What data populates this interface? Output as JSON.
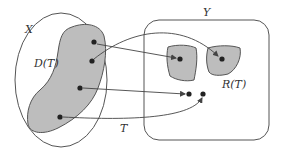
{
  "diagram": {
    "colors": {
      "outline": "#555555",
      "fill": "#bdbdbd",
      "dot": "#222222",
      "arrow": "#444444",
      "background": "#ffffff"
    },
    "labels": {
      "set_x": "X",
      "set_y": "Y",
      "domain": "D(T)",
      "range": "R(T)",
      "map": "T"
    },
    "domain_points": [
      {
        "id": "d1",
        "x": 94,
        "y": 42
      },
      {
        "id": "d2",
        "x": 92,
        "y": 61
      },
      {
        "id": "d3",
        "x": 80,
        "y": 88
      },
      {
        "id": "d4",
        "x": 60,
        "y": 117
      }
    ],
    "range_points": [
      {
        "id": "r1",
        "x": 180,
        "y": 59
      },
      {
        "id": "r2",
        "x": 222,
        "y": 59
      },
      {
        "id": "r3",
        "x": 189,
        "y": 94
      },
      {
        "id": "r4",
        "x": 203,
        "y": 94
      }
    ],
    "mappings": [
      {
        "from": "d1",
        "to": "r1"
      },
      {
        "from": "d2",
        "to": "r2"
      },
      {
        "from": "d3",
        "to": "r3"
      },
      {
        "from": "d4",
        "to": "r4"
      }
    ]
  }
}
